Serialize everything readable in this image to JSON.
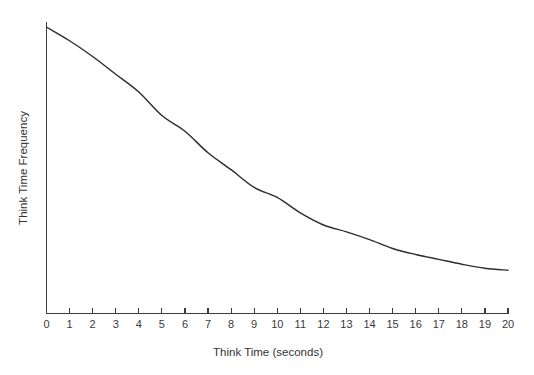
{
  "chart_data": {
    "type": "line",
    "title": "",
    "xlabel": "Think Time (seconds)",
    "ylabel": "Think Time Frequency",
    "xlim": [
      0,
      20
    ],
    "ylim": [
      0,
      1
    ],
    "grid": false,
    "legend": null,
    "x_tick_labels": [
      "0",
      "1",
      "2",
      "3",
      "4",
      "5",
      "6",
      "7",
      "8",
      "9",
      "10",
      "11",
      "12",
      "13",
      "14",
      "15",
      "16",
      "17",
      "18",
      "19",
      "20"
    ],
    "y_tick_labels": [],
    "x": [
      0,
      1,
      2,
      3,
      4,
      5,
      6,
      7,
      8,
      9,
      10,
      11,
      12,
      13,
      14,
      15,
      16,
      17,
      18,
      19,
      20
    ],
    "values": [
      1.0,
      0.952,
      0.897,
      0.835,
      0.773,
      0.691,
      0.636,
      0.561,
      0.502,
      0.44,
      0.405,
      0.351,
      0.309,
      0.285,
      0.258,
      0.227,
      0.206,
      0.189,
      0.172,
      0.158,
      0.151
    ],
    "series": [
      {
        "name": "Think time frequency",
        "values": [
          1.0,
          0.952,
          0.897,
          0.835,
          0.773,
          0.691,
          0.636,
          0.561,
          0.502,
          0.44,
          0.405,
          0.351,
          0.309,
          0.285,
          0.258,
          0.227,
          0.206,
          0.189,
          0.172,
          0.158,
          0.151
        ]
      }
    ],
    "line_color": "#2e2e2e",
    "axis_color": "#3b3b3b",
    "background_color": "#ffffff"
  }
}
